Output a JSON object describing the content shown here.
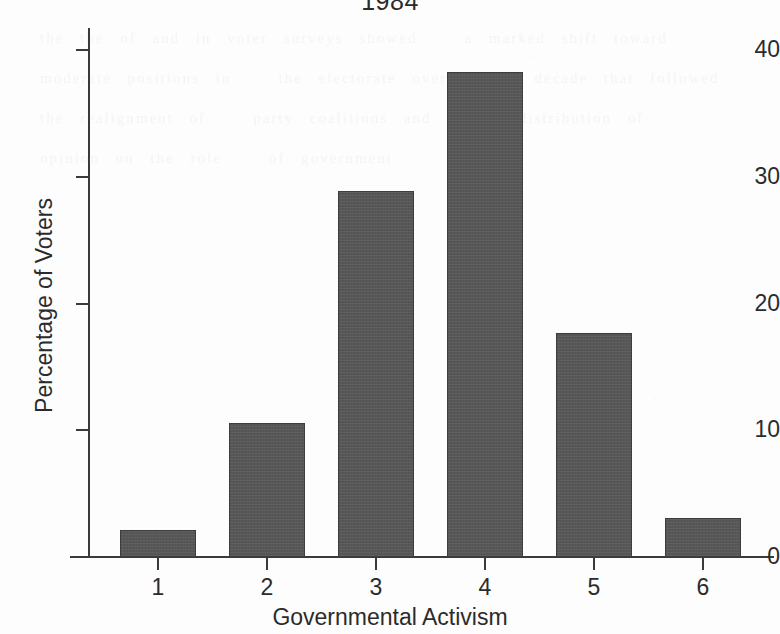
{
  "chart_data": {
    "type": "bar",
    "title": "1984",
    "xlabel": "Governmental Activism",
    "ylabel": "Percentage of Voters",
    "categories": [
      "1",
      "2",
      "3",
      "4",
      "5",
      "6"
    ],
    "values": [
      2.1,
      10.6,
      28.9,
      38.3,
      17.7,
      3.1
    ],
    "ylim": [
      0,
      42
    ],
    "yticks": [
      0,
      10,
      20,
      30,
      40
    ],
    "ytick_labels": [
      "0",
      "10",
      "20",
      "30",
      "40"
    ],
    "grid": false,
    "legend": null,
    "bar_color": "#575757",
    "axis_color": "#3a3a3a",
    "background_color": "#fdfdfd"
  },
  "bleed_text": "the the of and in voter surveys showed   a marked shift toward   moderate positions in   the electorate over   the decade that followed   the realignment of   party coalitions and   the distribution of   opinion on the role   of government"
}
